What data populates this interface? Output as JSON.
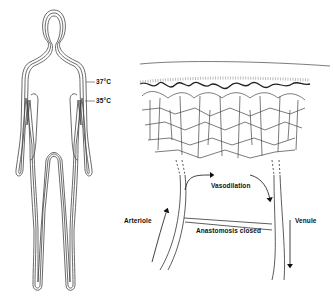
{
  "figure": {
    "left_panel": {
      "subject": "human-body-isotherms",
      "labels": {
        "outer_isotherm": "37°C",
        "inner_isotherm": "35°C"
      }
    },
    "right_panel": {
      "subject": "skin-microcirculation",
      "labels": {
        "vasodilation": "Vasodilation",
        "arteriole": "Arteriole",
        "anastomosis": "Anastomosis closed",
        "venule": "Venule"
      }
    },
    "colors": {
      "line": "#333333",
      "background": "#ffffff"
    }
  }
}
